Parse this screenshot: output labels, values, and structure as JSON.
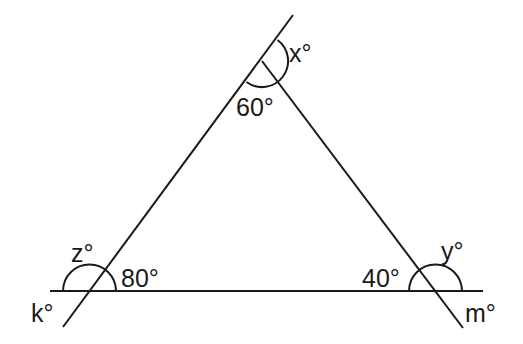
{
  "diagram": {
    "type": "triangle-exterior-angles",
    "labels": {
      "apex_interior": "60°",
      "apex_exterior": "x°",
      "left_interior": "80°",
      "left_exterior_top": "z°",
      "left_exterior_bottom": "k°",
      "right_interior": "40°",
      "right_exterior_top": "y°",
      "right_exterior_bottom": "m°"
    },
    "angles": {
      "apex": 60,
      "left_base": 80,
      "right_base": 40
    },
    "stroke_color": "#1a1a1a",
    "background": "#ffffff"
  }
}
